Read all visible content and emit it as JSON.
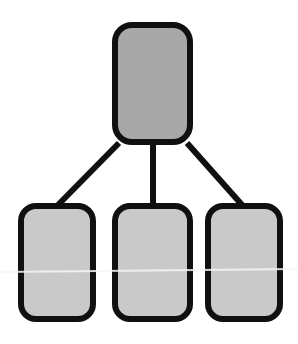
{
  "diagram": {
    "type": "tree",
    "background_color": "#ffffff",
    "stroke_color": "#101010",
    "stroke_width": 6,
    "corner_radius": 16,
    "parent_fill": "#a8a8a8",
    "child_fill": "#c9c9c9",
    "artifact_line_color": "#f4f4f4",
    "nodes": [
      {
        "id": "root",
        "role": "parent",
        "label": "",
        "fill": "#a8a8a8",
        "x": 112,
        "y": 22,
        "width": 81,
        "height": 123,
        "radius": 17
      },
      {
        "id": "child-left",
        "role": "child",
        "label": "",
        "fill": "#c9c9c9",
        "x": 18,
        "y": 203,
        "width": 78,
        "height": 119,
        "radius": 15
      },
      {
        "id": "child-middle",
        "role": "child",
        "label": "",
        "fill": "#c9c9c9",
        "x": 112,
        "y": 203,
        "width": 81,
        "height": 119,
        "radius": 15
      },
      {
        "id": "child-right",
        "role": "child",
        "label": "",
        "fill": "#c9c9c9",
        "x": 205,
        "y": 203,
        "width": 78,
        "height": 119,
        "radius": 15
      }
    ],
    "connectors": [
      {
        "id": "edge-root-to-left",
        "from": "root",
        "to": "child-left",
        "kind": "diagonal",
        "x1": 119,
        "y1": 143,
        "x2": 57,
        "y2": 204
      },
      {
        "id": "edge-root-to-middle",
        "from": "root",
        "to": "child-middle",
        "kind": "vertical",
        "x1": 153,
        "y1": 143,
        "x2": 153,
        "y2": 204
      },
      {
        "id": "edge-root-to-right",
        "from": "root",
        "to": "child-right",
        "kind": "diagonal",
        "x1": 187,
        "y1": 143,
        "x2": 243,
        "y2": 204
      }
    ],
    "artifacts": [
      {
        "id": "scanline",
        "kind": "horizontal-scan-line",
        "x1": 0,
        "y1": 272,
        "x2": 298,
        "y2": 269,
        "color": "#f6f6f6",
        "width": 2
      }
    ]
  }
}
